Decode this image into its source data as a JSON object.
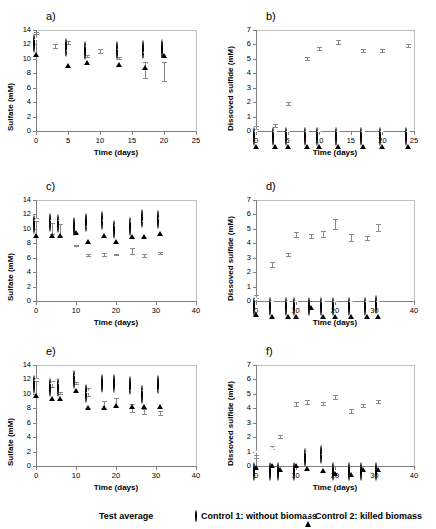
{
  "figure": {
    "layout": "3 rows x 2 columns of scatter panels with shared legend",
    "panel_labels": [
      "a)",
      "b)",
      "c)",
      "d)",
      "e)",
      "f)"
    ]
  },
  "legend": {
    "items": [
      {
        "marker": "filled-diamond",
        "label": "Test average"
      },
      {
        "marker": "open-circle",
        "label": "Control 1: without biomass"
      },
      {
        "marker": "open-triangle",
        "label": "Control 2: killed biomass"
      }
    ]
  },
  "chart_data": [
    {
      "panel": "a)",
      "type": "scatter",
      "title": "",
      "xlabel": "Time (days)",
      "ylabel": "Sulfate (mM)",
      "xlim": [
        0,
        25
      ],
      "ylim": [
        0,
        14
      ],
      "xticks": [
        0,
        5,
        10,
        15,
        20,
        25
      ],
      "yticks": [
        0,
        2,
        4,
        6,
        8,
        10,
        12,
        14
      ],
      "grid": false,
      "series": [
        {
          "name": "Test average",
          "marker": "filled-diamond",
          "x": [
            0,
            3,
            5,
            8,
            10,
            13,
            17,
            20
          ],
          "values": [
            13.6,
            11.8,
            12.3,
            10.4,
            11.1,
            10.1,
            8.45,
            8.25
          ],
          "yerr": [
            0.15,
            0.3,
            0.2,
            0.15,
            0.3,
            0.15,
            1.1,
            1.35
          ]
        },
        {
          "name": "Control 1: without biomass",
          "marker": "open-circle",
          "x": [
            0,
            5,
            8,
            13,
            17,
            20
          ],
          "values": [
            12.85,
            12.4,
            11.95,
            11.9,
            12.0,
            12.25
          ]
        },
        {
          "name": "Control 2: killed biomass",
          "marker": "open-triangle",
          "x": [
            0,
            5,
            8,
            13,
            17,
            20
          ],
          "values": [
            12.85,
            11.35,
            11.85,
            11.45,
            11.05,
            12.7
          ]
        }
      ]
    },
    {
      "panel": "b)",
      "type": "scatter",
      "title": "",
      "xlabel": "Time (days)",
      "ylabel": "Dissoved sulfide (mM)",
      "xlim": [
        0,
        25
      ],
      "ylim": [
        0,
        7
      ],
      "xticks": [
        0,
        5,
        10,
        15,
        20,
        25
      ],
      "yticks": [
        0,
        1,
        2,
        3,
        4,
        5,
        6,
        7
      ],
      "grid": false,
      "series": [
        {
          "name": "Test average",
          "marker": "filled-diamond",
          "x": [
            0,
            3,
            5,
            8,
            10,
            13,
            17,
            20,
            24
          ],
          "values": [
            0.25,
            0.38,
            1.9,
            5.02,
            5.72,
            6.18,
            5.58,
            5.58,
            5.95
          ],
          "yerr": [
            0.1,
            0.08,
            0.12,
            0.12,
            0.1,
            0.12,
            0.12,
            0.1,
            0.1
          ]
        },
        {
          "name": "Control 1: without biomass",
          "marker": "open-circle",
          "x": [
            0,
            3,
            5,
            8,
            10,
            13,
            17,
            20,
            24
          ],
          "values": [
            0.03,
            0.03,
            0.03,
            0.03,
            0.03,
            0.03,
            0.03,
            0.03,
            0.03
          ]
        },
        {
          "name": "Control 2: killed biomass",
          "marker": "open-triangle",
          "x": [
            0,
            3,
            5,
            8,
            10,
            13,
            17,
            20,
            24
          ],
          "values": [
            0.06,
            0.06,
            0.06,
            0.06,
            0.06,
            0.06,
            0.06,
            0.06,
            0.06
          ]
        }
      ]
    },
    {
      "panel": "c)",
      "type": "scatter",
      "title": "",
      "xlabel": "Time (days)",
      "ylabel": "Sulfate (mM)",
      "xlim": [
        0,
        40
      ],
      "ylim": [
        0,
        14
      ],
      "xticks": [
        0,
        10,
        20,
        30,
        40
      ],
      "yticks": [
        0,
        2,
        4,
        6,
        8,
        10,
        12,
        14
      ],
      "grid": false,
      "series": [
        {
          "name": "Test average",
          "marker": "filled-diamond",
          "x": [
            0,
            4,
            6,
            10,
            13,
            17,
            20,
            24,
            27,
            31
          ],
          "values": [
            11.3,
            10.05,
            9.85,
            7.7,
            6.4,
            6.4,
            6.45,
            6.95,
            6.3,
            6.65
          ],
          "yerr": [
            0.15,
            0.75,
            0.8,
            0.12,
            0.15,
            0.2,
            0.12,
            0.45,
            0.2,
            0.12
          ]
        },
        {
          "name": "Control 1: without biomass",
          "marker": "open-circle",
          "x": [
            0,
            4,
            6,
            10,
            13,
            17,
            20,
            24,
            27,
            31
          ],
          "values": [
            11.3,
            11.7,
            11.45,
            11.1,
            11.6,
            11.95,
            10.65,
            11.05,
            12.2,
            12.1
          ]
        },
        {
          "name": "Control 2: killed biomass",
          "marker": "open-triangle",
          "x": [
            0,
            4,
            6,
            10,
            13,
            17,
            20,
            24,
            27,
            31
          ],
          "values": [
            11.3,
            11.35,
            11.3,
            11.85,
            10.5,
            11.3,
            10.6,
            11.2,
            11.2,
            11.6
          ]
        }
      ]
    },
    {
      "panel": "d)",
      "type": "scatter",
      "title": "",
      "xlabel": "Time (days)",
      "ylabel": "Dissoved sulfide (mM)",
      "xlim": [
        0,
        40
      ],
      "ylim": [
        0,
        7
      ],
      "xticks": [
        0,
        10,
        20,
        30,
        40
      ],
      "yticks": [
        0,
        1,
        2,
        3,
        4,
        5,
        6,
        7
      ],
      "grid": false,
      "series": [
        {
          "name": "Test average",
          "marker": "filled-diamond",
          "x": [
            0,
            4,
            8,
            10,
            14,
            17,
            20,
            24,
            28,
            31
          ],
          "values": [
            0.3,
            2.55,
            3.25,
            4.62,
            4.52,
            4.65,
            5.35,
            4.4,
            4.37,
            5.1
          ],
          "yerr": [
            0.12,
            0.18,
            0.1,
            0.15,
            0.12,
            0.2,
            0.33,
            0.22,
            0.12,
            0.25
          ]
        },
        {
          "name": "Control 1: without biomass",
          "marker": "open-circle",
          "x": [
            0,
            4,
            8,
            10,
            14,
            17,
            20,
            24,
            28,
            31
          ],
          "values": [
            0.03,
            0.03,
            0.03,
            0.03,
            0.03,
            0.03,
            0.03,
            0.03,
            0.03,
            0.12
          ]
        },
        {
          "name": "Control 2: killed biomass",
          "marker": "open-triangle",
          "x": [
            0,
            4,
            8,
            10,
            14,
            17,
            20,
            24,
            28,
            31
          ],
          "values": [
            0.2,
            0.06,
            0.06,
            0.06,
            0.68,
            0.06,
            0.06,
            0.06,
            0.06,
            0.06
          ]
        }
      ]
    },
    {
      "panel": "e)",
      "type": "scatter",
      "title": "",
      "xlabel": "Time (days)",
      "ylabel": "Sulfate (mM)",
      "xlim": [
        0,
        40
      ],
      "ylim": [
        0,
        14
      ],
      "xticks": [
        0,
        10,
        20,
        30,
        40
      ],
      "yticks": [
        0,
        2,
        4,
        6,
        8,
        10,
        12,
        14
      ],
      "grid": false,
      "series": [
        {
          "name": "Test average",
          "marker": "filled-diamond",
          "x": [
            0,
            4,
            6,
            10,
            13,
            17,
            20,
            24,
            27,
            31
          ],
          "values": [
            12.0,
            11.35,
            10.15,
            11.5,
            10.3,
            8.45,
            8.9,
            8.05,
            7.6,
            7.35
          ],
          "yerr": [
            0.2,
            0.45,
            0.15,
            0.12,
            0.55,
            0.5,
            0.55,
            0.5,
            0.35,
            0.3
          ]
        },
        {
          "name": "Control 1: without biomass",
          "marker": "open-circle",
          "x": [
            0,
            4,
            6,
            10,
            13,
            17,
            20,
            24,
            27,
            31
          ],
          "values": [
            12.0,
            11.65,
            11.7,
            12.8,
            10.75,
            12.25,
            12.25,
            11.9,
            10.65,
            12.1
          ]
        },
        {
          "name": "Control 2: killed biomass",
          "marker": "open-triangle",
          "x": [
            0,
            4,
            6,
            10,
            13,
            17,
            20,
            24,
            27,
            31
          ],
          "values": [
            12.0,
            11.6,
            11.6,
            12.75,
            10.4,
            10.4,
            10.65,
            10.6,
            10.6,
            10.55
          ]
        }
      ]
    },
    {
      "panel": "f)",
      "type": "scatter",
      "title": "",
      "xlabel": "Time (days)",
      "ylabel": "Dissoved sulfide (mM)",
      "xlim": [
        0,
        40
      ],
      "ylim": [
        0,
        7
      ],
      "xticks": [
        0,
        10,
        20,
        30,
        40
      ],
      "yticks": [
        0,
        1,
        2,
        3,
        4,
        5,
        6,
        7
      ],
      "grid": false,
      "series": [
        {
          "name": "Test average",
          "marker": "filled-diamond",
          "x": [
            0,
            4,
            6,
            10,
            13,
            17,
            20,
            24,
            27,
            31
          ],
          "values": [
            0.65,
            1.3,
            2.02,
            4.3,
            4.45,
            4.35,
            4.78,
            3.8,
            4.2,
            4.48
          ],
          "yerr": [
            0.1,
            0.12,
            0.1,
            0.12,
            0.12,
            0.1,
            0.12,
            0.12,
            0.1,
            0.12
          ]
        },
        {
          "name": "Control 1: without biomass",
          "marker": "open-circle",
          "x": [
            0,
            4,
            6,
            10,
            13,
            17,
            20,
            24,
            27,
            31
          ],
          "values": [
            0.03,
            0.03,
            0.03,
            0.03,
            1.0,
            1.15,
            0.03,
            0.03,
            0.03,
            0.03
          ]
        },
        {
          "name": "Control 2: killed biomass",
          "marker": "open-triangle",
          "x": [
            0,
            4,
            6,
            10,
            13,
            17,
            20,
            24,
            27,
            31
          ],
          "values": [
            1.02,
            1.2,
            0.92,
            1.15,
            1.0,
            0.85,
            0.62,
            0.52,
            0.92,
            0.92
          ]
        }
      ]
    }
  ]
}
